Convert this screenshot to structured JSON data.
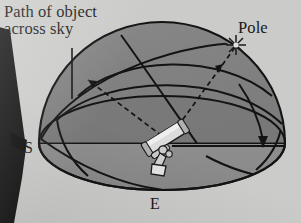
{
  "figure": {
    "type": "astronomy-diagram",
    "background_color": "#d6d6d4",
    "ink_color": "#1a1a1a",
    "dome_upper_color": "#8b8b8b",
    "dome_lower_color": "#9a9a9a",
    "dome_shadow_color": "#787878"
  },
  "labels": {
    "path_of_object": "Path of object\nacross sky",
    "pole": "Pole",
    "south": "S",
    "east": "E"
  },
  "icons": {
    "pole_star": "star-icon",
    "telescope": "telescope-icon",
    "tripod_leg": "tripod-leg-icon"
  },
  "annotations": {
    "leader_line": "label-leader-line",
    "object_path_arrow": "dashed-arrow-to-object-path",
    "pole_sight_line": "dashed-arrow-to-pole",
    "horizon_sight_line": "solid-line-to-west",
    "setting_arrow": "curved-arrow-setting"
  }
}
